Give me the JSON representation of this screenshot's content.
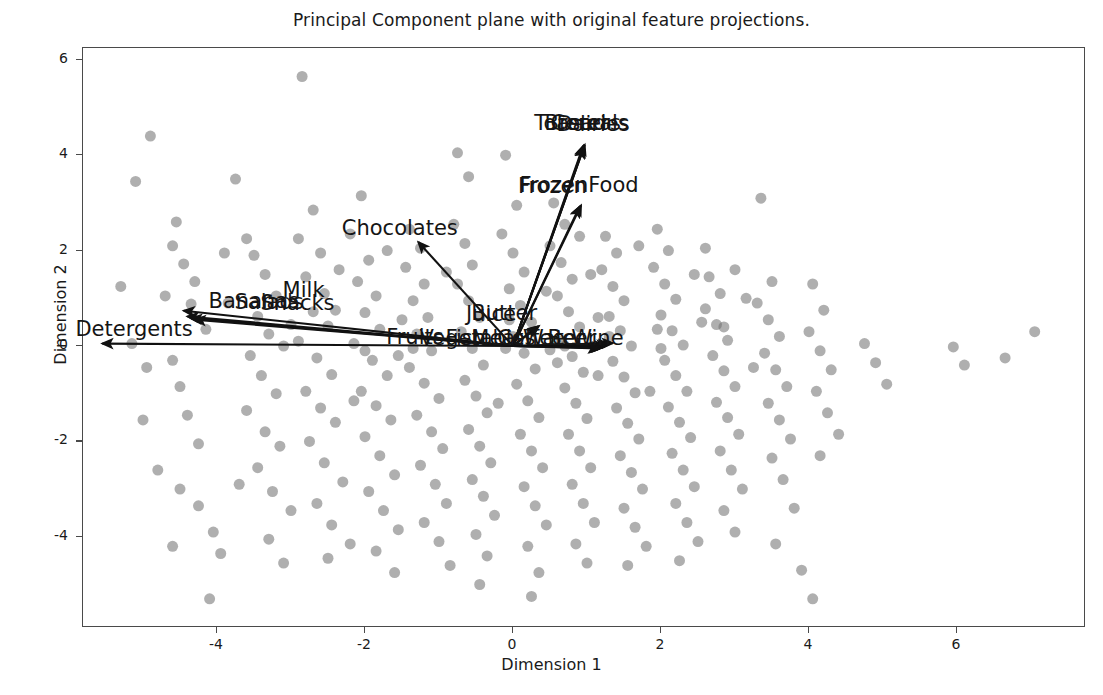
{
  "chart_data": {
    "type": "scatter",
    "title": "Principal Component plane with original feature projections.",
    "xlabel": "Dimension 1",
    "ylabel": "Dimension 2",
    "xlim": [
      -5.8,
      7.6
    ],
    "ylim": [
      -6.2,
      6.5
    ],
    "xticks": [
      -4,
      -2,
      0,
      2,
      4,
      6
    ],
    "yticks": [
      -4,
      -2,
      0,
      2,
      4,
      6
    ],
    "xtick_labels": [
      "-4",
      "-2",
      "0",
      "2",
      "4",
      "6"
    ],
    "ytick_labels": [
      "-4",
      "-2",
      "0",
      "2",
      "4",
      "6"
    ],
    "grid": false,
    "legend": "none",
    "point_color": "#6e6e6e",
    "point_opacity": 0.55,
    "point_size": 11,
    "arrow_color": "#111111",
    "frame_color": "#4a4a4a",
    "background": "#ffffff",
    "vectors": [
      {
        "label": "Toasters",
        "x": 0.95,
        "y": 4.2,
        "label_x": 0.3,
        "label_y": 4.62
      },
      {
        "label": "Cereals",
        "x": 0.97,
        "y": 4.22,
        "label_x": 0.52,
        "label_y": 4.62
      },
      {
        "label": "Bread",
        "x": 0.96,
        "y": 4.18,
        "label_x": 0.44,
        "label_y": 4.62
      },
      {
        "label": "Dairies",
        "x": 0.95,
        "y": 4.16,
        "label_x": 0.6,
        "label_y": 4.6
      },
      {
        "label": "FrozenFood",
        "x": 0.92,
        "y": 2.95,
        "label_x": 0.1,
        "label_y": 3.32
      },
      {
        "label": "Frozen",
        "x": 0.9,
        "y": 2.92,
        "label_x": 0.08,
        "label_y": 3.3
      },
      {
        "label": "Chocolates",
        "x": -1.28,
        "y": 2.18,
        "label_x": -2.3,
        "label_y": 2.42
      },
      {
        "label": "Milk",
        "x": -4.45,
        "y": 0.74,
        "label_x": -3.1,
        "label_y": 1.12
      },
      {
        "label": "Bananas",
        "x": -4.4,
        "y": 0.62,
        "label_x": -4.1,
        "label_y": 0.88
      },
      {
        "label": "Salads",
        "x": -4.35,
        "y": 0.58,
        "label_x": -3.75,
        "label_y": 0.86
      },
      {
        "label": "Snacks",
        "x": -4.3,
        "y": 0.55,
        "label_x": -3.4,
        "label_y": 0.84
      },
      {
        "label": "Detergents",
        "x": -5.55,
        "y": 0.05,
        "label_x": -5.9,
        "label_y": 0.3
      },
      {
        "label": "Butter",
        "x": 0.35,
        "y": 0.42,
        "label_x": -0.55,
        "label_y": 0.62
      },
      {
        "label": "Juice",
        "x": 0.32,
        "y": 0.4,
        "label_x": -0.62,
        "label_y": 0.6
      },
      {
        "label": "Fruits",
        "x": 1.35,
        "y": 0.06,
        "label_x": -1.7,
        "label_y": 0.12
      },
      {
        "label": "Vegetables",
        "x": 1.3,
        "y": 0.04,
        "label_x": -1.25,
        "label_y": 0.1
      },
      {
        "label": "Fish",
        "x": 1.28,
        "y": 0.02,
        "label_x": -0.9,
        "label_y": 0.1
      },
      {
        "label": "Meat",
        "x": 1.25,
        "y": 0.0,
        "label_x": -0.55,
        "label_y": 0.1
      },
      {
        "label": "Coffee",
        "x": 1.22,
        "y": -0.02,
        "label_x": -0.2,
        "label_y": 0.1
      },
      {
        "label": "Water",
        "x": 1.2,
        "y": -0.03,
        "label_x": 0.15,
        "label_y": 0.1
      },
      {
        "label": "Beer",
        "x": 1.18,
        "y": -0.04,
        "label_x": 0.48,
        "label_y": 0.1
      },
      {
        "label": "Wine",
        "x": 1.16,
        "y": -0.05,
        "label_x": 0.8,
        "label_y": 0.1
      }
    ],
    "points": [
      [
        -4.9,
        4.4
      ],
      [
        -5.1,
        3.45
      ],
      [
        -4.55,
        2.6
      ],
      [
        -4.6,
        2.1
      ],
      [
        -4.45,
        1.72
      ],
      [
        -4.3,
        1.35
      ],
      [
        -4.35,
        0.88
      ],
      [
        -4.6,
        -0.3
      ],
      [
        -4.5,
        -0.85
      ],
      [
        -4.4,
        -1.45
      ],
      [
        -4.25,
        -2.05
      ],
      [
        -4.5,
        -3.0
      ],
      [
        -4.25,
        -3.35
      ],
      [
        -4.05,
        -3.9
      ],
      [
        -4.6,
        -4.2
      ],
      [
        -3.95,
        -4.35
      ],
      [
        -4.1,
        -5.3
      ],
      [
        -3.75,
        3.5
      ],
      [
        -3.6,
        2.25
      ],
      [
        -3.5,
        1.9
      ],
      [
        -3.35,
        1.5
      ],
      [
        -3.2,
        1.05
      ],
      [
        -3.45,
        0.62
      ],
      [
        -3.3,
        0.25
      ],
      [
        -3.55,
        -0.2
      ],
      [
        -3.4,
        -0.62
      ],
      [
        -3.2,
        -1.0
      ],
      [
        -3.6,
        -1.35
      ],
      [
        -3.35,
        -1.8
      ],
      [
        -3.15,
        -2.1
      ],
      [
        -3.45,
        -2.55
      ],
      [
        -3.25,
        -3.05
      ],
      [
        -3.0,
        -3.45
      ],
      [
        -3.3,
        -4.05
      ],
      [
        -3.1,
        -4.55
      ],
      [
        -2.85,
        5.65
      ],
      [
        -2.7,
        2.85
      ],
      [
        -2.9,
        2.25
      ],
      [
        -2.6,
        1.95
      ],
      [
        -2.8,
        1.45
      ],
      [
        -2.55,
        1.1
      ],
      [
        -2.7,
        0.72
      ],
      [
        -2.5,
        0.42
      ],
      [
        -2.9,
        0.1
      ],
      [
        -2.65,
        -0.25
      ],
      [
        -2.45,
        -0.6
      ],
      [
        -2.8,
        -0.95
      ],
      [
        -2.6,
        -1.3
      ],
      [
        -2.4,
        -1.6
      ],
      [
        -2.75,
        -2.0
      ],
      [
        -2.55,
        -2.45
      ],
      [
        -2.3,
        -2.85
      ],
      [
        -2.65,
        -3.3
      ],
      [
        -2.45,
        -3.75
      ],
      [
        -2.2,
        -4.15
      ],
      [
        -2.5,
        -4.45
      ],
      [
        -2.05,
        3.15
      ],
      [
        -2.2,
        2.35
      ],
      [
        -1.95,
        1.8
      ],
      [
        -2.1,
        1.35
      ],
      [
        -1.85,
        1.05
      ],
      [
        -2.0,
        0.7
      ],
      [
        -1.8,
        0.35
      ],
      [
        -2.15,
        0.05
      ],
      [
        -1.9,
        -0.3
      ],
      [
        -1.7,
        -0.62
      ],
      [
        -2.05,
        -0.95
      ],
      [
        -1.85,
        -1.25
      ],
      [
        -1.65,
        -1.55
      ],
      [
        -2.0,
        -1.9
      ],
      [
        -1.8,
        -2.3
      ],
      [
        -1.6,
        -2.7
      ],
      [
        -1.95,
        -3.05
      ],
      [
        -1.75,
        -3.45
      ],
      [
        -1.55,
        -3.85
      ],
      [
        -1.85,
        -4.3
      ],
      [
        -1.6,
        -4.75
      ],
      [
        -1.4,
        2.45
      ],
      [
        -1.25,
        2.05
      ],
      [
        -1.45,
        1.65
      ],
      [
        -1.2,
        1.3
      ],
      [
        -1.35,
        0.95
      ],
      [
        -1.15,
        0.6
      ],
      [
        -1.3,
        0.25
      ],
      [
        -1.1,
        -0.1
      ],
      [
        -1.4,
        -0.45
      ],
      [
        -1.2,
        -0.78
      ],
      [
        -1.0,
        -1.1
      ],
      [
        -1.3,
        -1.45
      ],
      [
        -1.1,
        -1.8
      ],
      [
        -0.95,
        -2.15
      ],
      [
        -1.25,
        -2.5
      ],
      [
        -1.05,
        -2.9
      ],
      [
        -0.9,
        -3.3
      ],
      [
        -1.2,
        -3.7
      ],
      [
        -1.0,
        -4.1
      ],
      [
        -0.85,
        -4.6
      ],
      [
        -0.75,
        4.05
      ],
      [
        -0.6,
        3.55
      ],
      [
        -0.8,
        2.55
      ],
      [
        -0.65,
        2.15
      ],
      [
        -0.55,
        1.7
      ],
      [
        -0.75,
        1.3
      ],
      [
        -0.6,
        0.95
      ],
      [
        -0.45,
        0.6
      ],
      [
        -0.7,
        0.3
      ],
      [
        -0.55,
        -0.05
      ],
      [
        -0.4,
        -0.4
      ],
      [
        -0.65,
        -0.72
      ],
      [
        -0.5,
        -1.05
      ],
      [
        -0.35,
        -1.4
      ],
      [
        -0.6,
        -1.75
      ],
      [
        -0.45,
        -2.1
      ],
      [
        -0.3,
        -2.45
      ],
      [
        -0.55,
        -2.8
      ],
      [
        -0.4,
        -3.15
      ],
      [
        -0.25,
        -3.55
      ],
      [
        -0.5,
        -3.95
      ],
      [
        -0.35,
        -4.4
      ],
      [
        -0.45,
        -5.0
      ],
      [
        -0.1,
        4.0
      ],
      [
        0.05,
        2.95
      ],
      [
        -0.15,
        2.35
      ],
      [
        0.0,
        1.95
      ],
      [
        0.15,
        1.55
      ],
      [
        -0.05,
        1.2
      ],
      [
        0.1,
        0.85
      ],
      [
        0.25,
        0.5
      ],
      [
        0.0,
        0.2
      ],
      [
        0.15,
        -0.15
      ],
      [
        0.3,
        -0.48
      ],
      [
        0.05,
        -0.8
      ],
      [
        0.2,
        -1.15
      ],
      [
        0.35,
        -1.5
      ],
      [
        0.1,
        -1.85
      ],
      [
        0.25,
        -2.2
      ],
      [
        0.4,
        -2.55
      ],
      [
        0.15,
        -2.95
      ],
      [
        0.3,
        -3.35
      ],
      [
        0.45,
        -3.75
      ],
      [
        0.2,
        -4.2
      ],
      [
        0.35,
        -4.75
      ],
      [
        0.25,
        -5.25
      ],
      [
        0.55,
        3.0
      ],
      [
        0.7,
        2.55
      ],
      [
        0.5,
        2.1
      ],
      [
        0.65,
        1.75
      ],
      [
        0.8,
        1.4
      ],
      [
        0.6,
        1.05
      ],
      [
        0.75,
        0.72
      ],
      [
        0.9,
        0.4
      ],
      [
        0.65,
        0.1
      ],
      [
        0.8,
        -0.22
      ],
      [
        0.95,
        -0.55
      ],
      [
        0.7,
        -0.88
      ],
      [
        0.85,
        -1.2
      ],
      [
        1.0,
        -1.52
      ],
      [
        0.75,
        -1.85
      ],
      [
        0.9,
        -2.2
      ],
      [
        1.05,
        -2.55
      ],
      [
        0.8,
        -2.9
      ],
      [
        0.95,
        -3.3
      ],
      [
        1.1,
        -3.7
      ],
      [
        0.85,
        -4.15
      ],
      [
        1.0,
        -4.55
      ],
      [
        1.25,
        2.3
      ],
      [
        1.4,
        1.95
      ],
      [
        1.2,
        1.6
      ],
      [
        1.35,
        1.25
      ],
      [
        1.5,
        0.95
      ],
      [
        1.3,
        0.62
      ],
      [
        1.45,
        0.32
      ],
      [
        1.6,
        0.0
      ],
      [
        1.35,
        -0.32
      ],
      [
        1.5,
        -0.65
      ],
      [
        1.65,
        -0.98
      ],
      [
        1.4,
        -1.3
      ],
      [
        1.55,
        -1.62
      ],
      [
        1.7,
        -1.95
      ],
      [
        1.45,
        -2.3
      ],
      [
        1.6,
        -2.65
      ],
      [
        1.75,
        -3.0
      ],
      [
        1.5,
        -3.4
      ],
      [
        1.65,
        -3.8
      ],
      [
        1.8,
        -4.2
      ],
      [
        1.55,
        -4.6
      ],
      [
        1.95,
        2.45
      ],
      [
        2.1,
        2.0
      ],
      [
        1.9,
        1.65
      ],
      [
        2.05,
        1.3
      ],
      [
        2.2,
        0.98
      ],
      [
        2.0,
        0.65
      ],
      [
        2.15,
        0.32
      ],
      [
        2.3,
        0.02
      ],
      [
        2.05,
        -0.3
      ],
      [
        2.2,
        -0.62
      ],
      [
        2.35,
        -0.95
      ],
      [
        2.1,
        -1.28
      ],
      [
        2.25,
        -1.6
      ],
      [
        2.4,
        -1.92
      ],
      [
        2.15,
        -2.25
      ],
      [
        2.3,
        -2.6
      ],
      [
        2.45,
        -2.95
      ],
      [
        2.2,
        -3.3
      ],
      [
        2.35,
        -3.7
      ],
      [
        2.5,
        -4.1
      ],
      [
        2.25,
        -4.5
      ],
      [
        2.65,
        1.45
      ],
      [
        2.8,
        1.1
      ],
      [
        2.6,
        0.78
      ],
      [
        2.75,
        0.45
      ],
      [
        2.9,
        0.12
      ],
      [
        2.7,
        -0.2
      ],
      [
        2.85,
        -0.52
      ],
      [
        3.0,
        -0.85
      ],
      [
        2.75,
        -1.18
      ],
      [
        2.9,
        -1.5
      ],
      [
        3.05,
        -1.85
      ],
      [
        2.8,
        -2.2
      ],
      [
        2.95,
        -2.6
      ],
      [
        3.1,
        -3.0
      ],
      [
        2.85,
        -3.45
      ],
      [
        3.0,
        -3.9
      ],
      [
        3.35,
        3.1
      ],
      [
        3.5,
        1.35
      ],
      [
        3.3,
        0.9
      ],
      [
        3.45,
        0.55
      ],
      [
        3.6,
        0.2
      ],
      [
        3.4,
        -0.15
      ],
      [
        3.55,
        -0.5
      ],
      [
        3.7,
        -0.85
      ],
      [
        3.45,
        -1.2
      ],
      [
        3.6,
        -1.55
      ],
      [
        3.75,
        -1.95
      ],
      [
        3.5,
        -2.35
      ],
      [
        3.65,
        -2.8
      ],
      [
        3.8,
        -3.4
      ],
      [
        3.55,
        -4.15
      ],
      [
        3.9,
        -4.7
      ],
      [
        4.05,
        -5.3
      ],
      [
        4.05,
        1.3
      ],
      [
        4.2,
        0.75
      ],
      [
        4.0,
        0.3
      ],
      [
        4.15,
        -0.1
      ],
      [
        4.3,
        -0.5
      ],
      [
        4.1,
        -0.95
      ],
      [
        4.25,
        -1.4
      ],
      [
        4.4,
        -1.85
      ],
      [
        4.15,
        -2.3
      ],
      [
        4.75,
        0.05
      ],
      [
        4.9,
        -0.35
      ],
      [
        5.05,
        -0.8
      ],
      [
        5.95,
        -0.02
      ],
      [
        6.1,
        -0.4
      ],
      [
        7.05,
        0.3
      ],
      [
        6.65,
        -0.25
      ],
      [
        -5.3,
        1.25
      ],
      [
        -5.15,
        0.05
      ],
      [
        -5.0,
        -1.55
      ],
      [
        -4.8,
        -2.6
      ],
      [
        -4.95,
        -0.45
      ],
      [
        -3.85,
        0.9
      ],
      [
        -3.7,
        -2.9
      ],
      [
        -2.35,
        1.6
      ],
      [
        -2.15,
        -1.15
      ],
      [
        -1.5,
        0.55
      ],
      [
        0.45,
        1.15
      ],
      [
        1.15,
        -0.62
      ],
      [
        2.55,
        0.5
      ],
      [
        3.15,
        1.0
      ],
      [
        1.85,
        -0.95
      ],
      [
        -0.2,
        -1.2
      ],
      [
        0.6,
        -0.35
      ],
      [
        1.05,
        1.5
      ],
      [
        2.45,
        1.5
      ],
      [
        3.25,
        -0.45
      ],
      [
        -1.7,
        2.0
      ],
      [
        -0.9,
        1.55
      ],
      [
        0.9,
        2.3
      ],
      [
        1.7,
        2.1
      ],
      [
        2.6,
        2.05
      ],
      [
        3.0,
        1.6
      ],
      [
        -3.1,
        0.0
      ],
      [
        -2.0,
        -0.1
      ],
      [
        -0.1,
        -0.05
      ],
      [
        0.5,
        -0.08
      ],
      [
        1.3,
        0.2
      ],
      [
        2.0,
        -0.05
      ],
      [
        -4.15,
        0.35
      ],
      [
        -3.0,
        0.45
      ],
      [
        -1.55,
        -0.2
      ],
      [
        0.7,
        0.0
      ],
      [
        1.95,
        0.35
      ],
      [
        2.85,
        0.4
      ],
      [
        -4.7,
        1.05
      ],
      [
        -3.9,
        1.95
      ],
      [
        -2.4,
        0.75
      ],
      [
        -1.35,
        -0.05
      ],
      [
        -0.05,
        0.55
      ],
      [
        1.15,
        0.6
      ]
    ]
  }
}
